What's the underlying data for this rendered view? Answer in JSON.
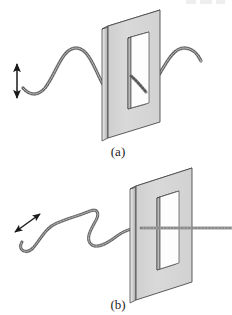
{
  "figure": {
    "width": 232,
    "height": 315,
    "background_color": "#ffffff"
  },
  "colors": {
    "plate_face": "#d6d6d6",
    "plate_face_shaded": "#c8c8c8",
    "plate_edge_light": "#e8e8e8",
    "plate_edge_dark": "#9a9a9a",
    "outline": "#4a4a4a",
    "slot_fill": "#ffffff",
    "rope": "#8e8e8e",
    "rope_dark": "#5a5a5a",
    "arrow": "#1a1a1a",
    "caption_text": "#1c1c1c"
  },
  "panels": [
    {
      "id": "a",
      "caption": "(a)",
      "caption_x": 118,
      "caption_y": 152,
      "polarization": "vertical",
      "arrow": {
        "name": "vertical-double-arrow",
        "orientation": "vertical",
        "x1": 17,
        "y1": 62,
        "x2": 17,
        "y2": 100,
        "double_headed": true
      },
      "wave_in": {
        "description": "vertically polarized transverse wave approaching the slot",
        "path": "M 23,88 C 30,96 38,96 45,88 C 56,74 62,48 76,48 C 90,48 96,74 104,86 C 110,94 118,94 125,88"
      },
      "wave_out": {
        "description": "wave continues, transmitted through the vertical slot",
        "path": "M 125,88 C 134,96 142,96 150,88 C 162,74 170,48 184,48 C 192,48 198,54 201,61"
      },
      "plate": {
        "name": "slotted-plate-a",
        "top_left": [
          108,
          26
        ],
        "top_right": [
          160,
          10
        ],
        "bottom_right": [
          160,
          122
        ],
        "bottom_left": [
          108,
          138
        ],
        "thickness": 6,
        "slot": {
          "top_left": [
            128,
            38
          ],
          "top_right": [
            146,
            33
          ],
          "bottom_right": [
            146,
            104
          ],
          "bottom_left": [
            128,
            109
          ]
        }
      }
    },
    {
      "id": "b",
      "caption": "(b)",
      "caption_x": 118,
      "caption_y": 305,
      "polarization": "horizontal",
      "arrow": {
        "name": "diagonal-double-arrow",
        "orientation": "diagonal",
        "x1": 13,
        "y1": 233,
        "x2": 42,
        "y2": 212,
        "double_headed": true
      },
      "wave_in": {
        "description": "horizontally polarized transverse wave drawn in perspective",
        "path": "M 22,242 C 18,250 26,254 32,248 C 40,240 44,228 56,224 C 72,218 80,216 90,212 C 98,209 100,214 95,222 C 90,230 86,240 92,244 C 98,248 108,242 116,236 C 124,230 132,228 140,228"
      },
      "wave_out": {
        "description": "blocked: only a faint straight line emerges to the right",
        "path": "M 140,228 L 232,228"
      },
      "plate": {
        "name": "slotted-plate-b",
        "top_left": [
          136,
          186
        ],
        "top_right": [
          192,
          168
        ],
        "bottom_right": [
          192,
          282
        ],
        "bottom_left": [
          136,
          300
        ],
        "thickness": 6,
        "slot": {
          "top_left": [
            157,
            198
          ],
          "top_right": [
            176,
            192
          ],
          "bottom_right": [
            176,
            264
          ],
          "bottom_left": [
            157,
            270
          ]
        }
      }
    }
  ],
  "icons": {
    "arrow_head": "triangle-arrowhead",
    "rope": "coiled-rope-wave"
  }
}
